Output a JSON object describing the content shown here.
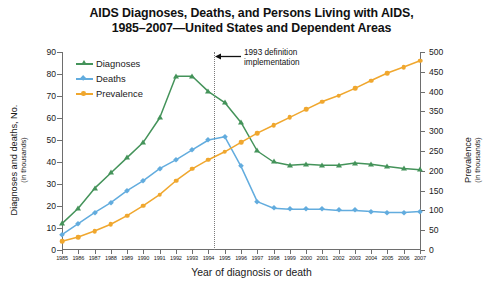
{
  "chart_data": {
    "type": "line",
    "title": "AIDS Diagnoses, Deaths, and Persons Living with AIDS, 1985–2007—United States and Dependent Areas",
    "title_line1": "AIDS Diagnoses, Deaths, and Persons Living with AIDS,",
    "title_line2": "1985–2007—United States and Dependent Areas",
    "xlabel": "Year of diagnosis or death",
    "ylabel": "Diagnoses and deaths, No.",
    "ylabel_sub": "(in thousands)",
    "ylabel_right": "Prevalence",
    "ylabel_right_sub": "(in thousands)",
    "grid": false,
    "legend_position": "upper-left-inside",
    "ylim": [
      0,
      90
    ],
    "ylim_right": [
      0,
      500
    ],
    "yticks": [
      0,
      10,
      20,
      30,
      40,
      50,
      60,
      70,
      80,
      90
    ],
    "yticks_right": [
      0,
      50,
      100,
      150,
      200,
      250,
      300,
      350,
      400,
      450,
      500
    ],
    "categories": [
      "1985",
      "1986",
      "1987",
      "1988",
      "1989",
      "1990",
      "1991",
      "1992",
      "1993",
      "1994",
      "1995",
      "1996",
      "1997",
      "1998",
      "1999",
      "2000",
      "2001",
      "2002",
      "2003",
      "2004",
      "2005",
      "2006",
      "2007"
    ],
    "x": [
      1985,
      1986,
      1987,
      1988,
      1989,
      1990,
      1991,
      1992,
      1993,
      1994,
      1995,
      1996,
      1997,
      1998,
      1999,
      2000,
      2001,
      2002,
      2003,
      2004,
      2005,
      2006,
      2007
    ],
    "series": [
      {
        "name": "Diagnoses",
        "color": "#44935a",
        "marker": "triangle",
        "axis": "left",
        "units": "thousands",
        "values": [
          12.0,
          19.0,
          28.0,
          35.0,
          42.0,
          49.0,
          60.0,
          79.0,
          79.0,
          72.0,
          67.0,
          58.0,
          45.0,
          40.0,
          38.5,
          39.0,
          38.5,
          38.5,
          39.5,
          39.0,
          38.0,
          37.0,
          36.5
        ]
      },
      {
        "name": "Deaths",
        "color": "#62acde",
        "marker": "diamond",
        "axis": "left",
        "units": "thousands",
        "values": [
          7.0,
          12.0,
          17.0,
          21.5,
          27.0,
          31.5,
          37.0,
          41.0,
          45.5,
          50.0,
          51.5,
          38.0,
          22.0,
          19.0,
          18.5,
          18.5,
          18.5,
          18.0,
          18.0,
          17.5,
          17.0,
          17.0,
          17.5
        ]
      },
      {
        "name": "Prevalence",
        "color": "#f0a72e",
        "marker": "circle",
        "axis": "right",
        "units": "thousands",
        "values": [
          22,
          33,
          48,
          65,
          87,
          112,
          140,
          175,
          205,
          228,
          248,
          272,
          295,
          315,
          335,
          355,
          375,
          390,
          408,
          428,
          447,
          462,
          478
        ]
      }
    ],
    "annotations": [
      {
        "name": "definition-change",
        "text_line1": "1993 definition",
        "text_line2": "implementation",
        "at_x": 1993,
        "style": "dotted-vertical-line-with-left-arrow"
      }
    ]
  }
}
